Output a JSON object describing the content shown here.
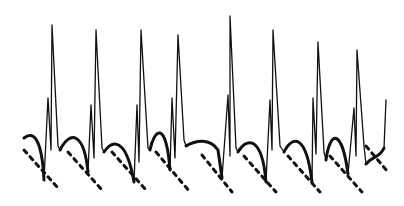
{
  "figure": {
    "title": "",
    "stroke_color": "#111111",
    "background": "#ffffff",
    "beats": [
      {
        "spike_x": 52,
        "spike_top": 25,
        "peak_x": 48,
        "peak_top": 98
      },
      {
        "spike_x": 96,
        "spike_top": 30,
        "peak_x": 91,
        "peak_top": 105
      },
      {
        "spike_x": 141,
        "spike_top": 30,
        "peak_x": 137,
        "peak_top": 105
      },
      {
        "spike_x": 178,
        "spike_top": 35,
        "peak_x": 172,
        "peak_top": 98
      },
      {
        "spike_x": 230,
        "spike_top": 16,
        "peak_x": 228,
        "peak_top": 95
      },
      {
        "spike_x": 273,
        "spike_top": 30,
        "peak_x": 270,
        "peak_top": 100
      },
      {
        "spike_x": 318,
        "spike_top": 42,
        "peak_x": 313,
        "peak_top": 98
      },
      {
        "spike_x": 357,
        "spike_top": 50,
        "peak_x": 354,
        "peak_top": 108
      }
    ]
  }
}
